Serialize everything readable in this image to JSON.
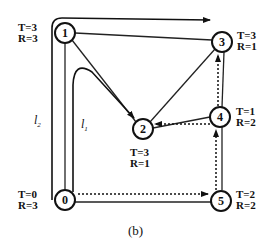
{
  "nodes": [
    {
      "id": "0",
      "label": "0",
      "T": "T=0",
      "R": "R=3"
    },
    {
      "id": "1",
      "label": "1",
      "T": "T=3",
      "R": "R=3"
    },
    {
      "id": "2",
      "label": "2",
      "T": "T=3",
      "R": "R=1"
    },
    {
      "id": "3",
      "label": "3",
      "T": "T=3",
      "R": "R=1"
    },
    {
      "id": "4",
      "label": "4",
      "T": "T=1",
      "R": "R=2"
    },
    {
      "id": "5",
      "label": "5",
      "T": "T=2",
      "R": "R=2"
    }
  ],
  "paths": {
    "l1": {
      "name": "l",
      "sub": "1"
    },
    "l2": {
      "name": "l",
      "sub": "2"
    }
  },
  "edges": [
    {
      "from": "0",
      "to": "1",
      "style": "solid"
    },
    {
      "from": "1",
      "to": "3",
      "style": "solid"
    },
    {
      "from": "1",
      "to": "2",
      "style": "solid"
    },
    {
      "from": "2",
      "to": "3",
      "style": "solid"
    },
    {
      "from": "2",
      "to": "4",
      "style": "solid"
    },
    {
      "from": "3",
      "to": "4",
      "style": "solid"
    },
    {
      "from": "4",
      "to": "5",
      "style": "solid"
    },
    {
      "from": "0",
      "to": "5",
      "style": "solid"
    }
  ],
  "caption": "(b)"
}
